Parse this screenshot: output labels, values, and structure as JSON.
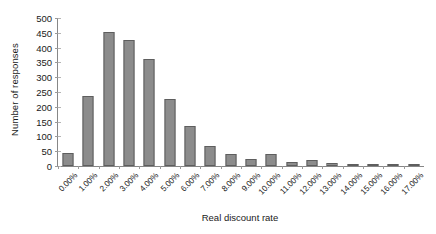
{
  "chart_data": {
    "type": "bar",
    "title": "",
    "xlabel": "Real discount rate",
    "ylabel": "Number of responses",
    "categories": [
      "0.00%",
      "1.00%",
      "2.00%",
      "3.00%",
      "4.00%",
      "5.00%",
      "6.00%",
      "7.00%",
      "8.00%",
      "9.00%",
      "10.00%",
      "11.00%",
      "12.00%",
      "13.00%",
      "14.00%",
      "15.00%",
      "16.00%",
      "17.00%"
    ],
    "values": [
      45,
      237,
      453,
      425,
      360,
      228,
      136,
      69,
      42,
      25,
      41,
      13,
      21,
      9,
      4,
      6,
      2,
      1
    ],
    "ylim": [
      0,
      500
    ],
    "ytick_values": [
      0,
      50,
      100,
      150,
      200,
      250,
      300,
      350,
      400,
      450,
      500
    ],
    "ytick_labels": [
      "0",
      "50",
      "100",
      "150",
      "200",
      "250",
      "300",
      "350",
      "400",
      "450",
      "500"
    ],
    "grid": false,
    "legend": false,
    "legend_position": "none",
    "bar_color": "#8c8c8c",
    "bar_edge_color": "#5e5e5e",
    "axis_color": "#878787",
    "background_color": "#ffffff",
    "xtick_label_rotation": -45
  }
}
